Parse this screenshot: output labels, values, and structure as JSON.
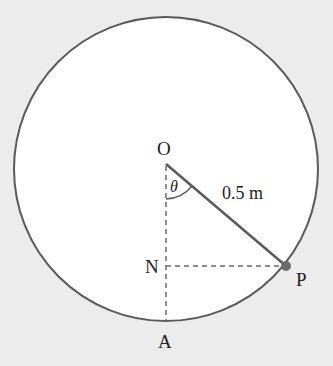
{
  "diagram": {
    "type": "circular-motion-geometry",
    "colors": {
      "background": "#ececec",
      "circle_fill": "#ffffff",
      "stroke": "#5a5a5a",
      "point_fill": "#6b6b6b",
      "text": "#222222"
    },
    "circle": {
      "center": [
        166,
        169
      ],
      "radius": 152
    },
    "points": {
      "O": {
        "label": "O",
        "x": 166,
        "y": 164
      },
      "P": {
        "label": "P",
        "x": 286,
        "y": 266
      },
      "N": {
        "label": "N",
        "x": 166,
        "y": 266
      },
      "A": {
        "label": "A",
        "x": 166,
        "y": 321
      }
    },
    "labels": {
      "O": "O",
      "P": "P",
      "N": "N",
      "A": "A",
      "radius_length": "0.5 m",
      "angle": "θ"
    },
    "segments": [
      {
        "from": "O",
        "to": "P",
        "style": "solid",
        "label": "0.5 m"
      },
      {
        "from": "O",
        "to": "A",
        "style": "dashed"
      },
      {
        "from": "N",
        "to": "P",
        "style": "dashed"
      }
    ],
    "angle": {
      "vertex": "O",
      "between": [
        "OA",
        "OP"
      ],
      "label": "θ"
    }
  }
}
